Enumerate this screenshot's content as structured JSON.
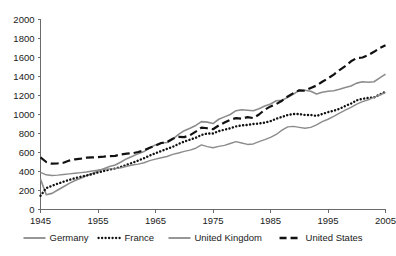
{
  "chart_data": {
    "type": "line",
    "title": "",
    "subtitle": "",
    "xlabel": "",
    "ylabel": "",
    "xlim": [
      1945,
      2005
    ],
    "ylim": [
      0,
      2000
    ],
    "grid": false,
    "legend_position": "bottom",
    "y_ticks": [
      0,
      200,
      400,
      600,
      800,
      1000,
      1200,
      1400,
      1600,
      1800,
      2000
    ],
    "y_tick_labels": [
      "0",
      "200",
      "400",
      "600",
      "800",
      "1000",
      "1200",
      "1400",
      "1600",
      "1800",
      "2000"
    ],
    "x_ticks": [
      1945,
      1955,
      1965,
      1975,
      1985,
      1995,
      2005
    ],
    "x_tick_labels": [
      "1945",
      "1955",
      "1965",
      "1975",
      "1985",
      "1995",
      "2005"
    ],
    "x": [
      1945,
      1946,
      1947,
      1948,
      1949,
      1950,
      1951,
      1952,
      1953,
      1954,
      1955,
      1956,
      1957,
      1958,
      1959,
      1960,
      1961,
      1962,
      1963,
      1964,
      1965,
      1966,
      1967,
      1968,
      1969,
      1970,
      1971,
      1972,
      1973,
      1974,
      1975,
      1976,
      1977,
      1978,
      1979,
      1980,
      1981,
      1982,
      1983,
      1984,
      1985,
      1986,
      1987,
      1988,
      1989,
      1990,
      1991,
      1992,
      1993,
      1994,
      1995,
      1996,
      1997,
      1998,
      1999,
      2000,
      2001,
      2002,
      2003,
      2004,
      2005
    ],
    "series": [
      {
        "name": "Germany",
        "style": "solid",
        "color": "#8c8c8c",
        "width": 1.6,
        "values": [
          320,
          155,
          170,
          205,
          240,
          275,
          305,
          330,
          355,
          380,
          405,
          430,
          452,
          468,
          500,
          535,
          560,
          588,
          610,
          650,
          680,
          700,
          705,
          740,
          790,
          830,
          855,
          885,
          925,
          920,
          905,
          950,
          975,
          1000,
          1040,
          1050,
          1045,
          1040,
          1060,
          1090,
          1110,
          1145,
          1150,
          1180,
          1215,
          1255,
          1255,
          1245,
          1215,
          1235,
          1245,
          1250,
          1265,
          1285,
          1300,
          1330,
          1345,
          1340,
          1345,
          1385,
          1425
        ]
      },
      {
        "name": "France",
        "style": "dotted",
        "color": "#111111",
        "width": 2.4,
        "values": [
          145,
          225,
          250,
          272,
          292,
          312,
          330,
          345,
          358,
          372,
          390,
          405,
          420,
          432,
          448,
          470,
          492,
          515,
          540,
          568,
          592,
          615,
          638,
          660,
          690,
          715,
          735,
          755,
          785,
          800,
          800,
          825,
          840,
          855,
          875,
          885,
          890,
          900,
          905,
          915,
          930,
          955,
          975,
          995,
          1005,
          1005,
          995,
          995,
          985,
          1005,
          1025,
          1040,
          1060,
          1090,
          1115,
          1150,
          1165,
          1175,
          1180,
          1210,
          1240
        ]
      },
      {
        "name": "United Kingdom",
        "style": "solid",
        "color": "#8c8c8c",
        "width": 1.4,
        "values": [
          390,
          365,
          358,
          362,
          368,
          375,
          382,
          388,
          395,
          405,
          415,
          422,
          428,
          430,
          440,
          455,
          468,
          478,
          492,
          515,
          530,
          545,
          558,
          580,
          595,
          612,
          625,
          645,
          680,
          662,
          650,
          665,
          675,
          695,
          715,
          700,
          685,
          690,
          715,
          735,
          760,
          790,
          835,
          870,
          875,
          865,
          855,
          865,
          890,
          925,
          950,
          980,
          1015,
          1045,
          1075,
          1110,
          1135,
          1155,
          1180,
          1205,
          1230
        ]
      },
      {
        "name": "United States",
        "style": "dashed",
        "color": "#111111",
        "width": 2.2,
        "values": [
          548,
          500,
          482,
          486,
          492,
          515,
          528,
          535,
          545,
          548,
          552,
          556,
          562,
          565,
          580,
          588,
          592,
          605,
          622,
          650,
          672,
          700,
          710,
          745,
          765,
          762,
          782,
          820,
          862,
          855,
          845,
          885,
          915,
          945,
          962,
          955,
          972,
          962,
          1000,
          1050,
          1085,
          1110,
          1145,
          1190,
          1225,
          1255,
          1250,
          1280,
          1305,
          1345,
          1380,
          1420,
          1468,
          1510,
          1560,
          1595,
          1600,
          1625,
          1660,
          1700,
          1730
        ]
      }
    ],
    "legend": [
      {
        "label": "Germany",
        "style": "solid",
        "color": "#8c8c8c"
      },
      {
        "label": "France",
        "style": "dotted",
        "color": "#111111"
      },
      {
        "label": "United Kingdom",
        "style": "solid",
        "color": "#8c8c8c"
      },
      {
        "label": "United States",
        "style": "dashed",
        "color": "#111111"
      }
    ]
  },
  "colors": {
    "axis": "#6b6b6b",
    "text": "#1a1a1a",
    "background": "#ffffff",
    "gray_series": "#8c8c8c",
    "black_series": "#111111"
  }
}
